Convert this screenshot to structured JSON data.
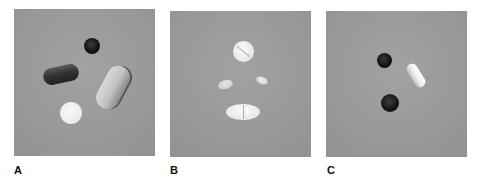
{
  "figure": {
    "panels": [
      {
        "label": "A",
        "background": "#9a9a9a",
        "items": [
          {
            "name": "black-round-tablet",
            "color": "#1a1a1a"
          },
          {
            "name": "dark-capsule",
            "color": "#3c3c3c"
          },
          {
            "name": "speckled-light-capsule",
            "color": "#c6c6c6"
          },
          {
            "name": "white-round-tablet",
            "color": "#f0f0f0"
          }
        ]
      },
      {
        "label": "B",
        "background": "#9a9a9a",
        "items": [
          {
            "name": "scored-round-tablet",
            "color": "#ececec"
          },
          {
            "name": "small-oval-tablet-left",
            "color": "#d2d2d2"
          },
          {
            "name": "small-oval-tablet-right",
            "color": "#dcdcdc"
          },
          {
            "name": "scored-oval-tablet",
            "color": "#eeeeee"
          }
        ]
      },
      {
        "label": "C",
        "background": "#9a9a9a",
        "items": [
          {
            "name": "small-black-round-tablet",
            "color": "#161616"
          },
          {
            "name": "white-capsule",
            "color": "#f2f2f2"
          },
          {
            "name": "large-black-round-tablet",
            "color": "#1c1c1c"
          }
        ]
      }
    ]
  }
}
